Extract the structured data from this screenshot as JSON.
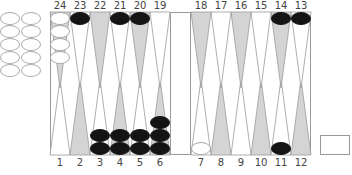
{
  "colors": {
    "light_point": "#ffffff",
    "dark_point": "#d4d4d4",
    "point_stroke": "#9a9a9a",
    "white_checker": "#ffffff",
    "black_checker": "#141414",
    "frame": "#9a9a9a"
  },
  "top_labels": [
    "24",
    "23",
    "22",
    "21",
    "20",
    "19",
    "18",
    "17",
    "16",
    "15",
    "14",
    "13"
  ],
  "bottom_labels": [
    "1",
    "2",
    "3",
    "4",
    "5",
    "6",
    "7",
    "8",
    "9",
    "10",
    "11",
    "12"
  ],
  "points": {
    "1": {
      "color": null,
      "count": 0
    },
    "2": {
      "color": null,
      "count": 0
    },
    "3": {
      "color": "black",
      "count": 2
    },
    "4": {
      "color": "black",
      "count": 2
    },
    "5": {
      "color": "black",
      "count": 2
    },
    "6": {
      "color": "black",
      "count": 3
    },
    "7": {
      "color": "white",
      "count": 1
    },
    "8": {
      "color": null,
      "count": 0
    },
    "9": {
      "color": null,
      "count": 0
    },
    "10": {
      "color": null,
      "count": 0
    },
    "11": {
      "color": "black",
      "count": 1
    },
    "12": {
      "color": null,
      "count": 0
    },
    "13": {
      "color": "black",
      "count": 1
    },
    "14": {
      "color": "black",
      "count": 1
    },
    "15": {
      "color": null,
      "count": 0
    },
    "16": {
      "color": null,
      "count": 0
    },
    "17": {
      "color": null,
      "count": 0
    },
    "18": {
      "color": null,
      "count": 0
    },
    "19": {
      "color": null,
      "count": 0
    },
    "20": {
      "color": "black",
      "count": 1
    },
    "21": {
      "color": "black",
      "count": 1
    },
    "22": {
      "color": null,
      "count": 0
    },
    "23": {
      "color": "black",
      "count": 1
    },
    "24": {
      "color": "white",
      "count": 4
    }
  },
  "borne_off": {
    "white": 10,
    "black": 0
  },
  "doubling_cube": {
    "value": ""
  }
}
